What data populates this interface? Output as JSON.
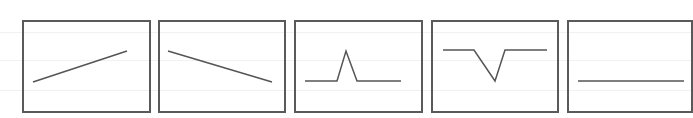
{
  "diagram": {
    "stroke_color": "#555555",
    "border_color": "#5a5a5a",
    "background_lines_y": [
      32,
      60,
      90
    ],
    "panels": [
      {
        "name": "rising-line",
        "frame": {
          "x": 22,
          "y": 20,
          "w": 125,
          "h": 89
        },
        "points": [
          [
            33,
            82
          ],
          [
            127,
            51
          ]
        ]
      },
      {
        "name": "falling-line",
        "frame": {
          "x": 158,
          "y": 20,
          "w": 125,
          "h": 89
        },
        "points": [
          [
            168,
            51
          ],
          [
            272,
            82
          ]
        ]
      },
      {
        "name": "peak-line",
        "frame": {
          "x": 294,
          "y": 20,
          "w": 126,
          "h": 89
        },
        "points": [
          [
            305,
            81
          ],
          [
            337,
            81
          ],
          [
            346,
            51
          ],
          [
            357,
            81
          ],
          [
            401,
            81
          ]
        ]
      },
      {
        "name": "valley-line",
        "frame": {
          "x": 431,
          "y": 20,
          "w": 125,
          "h": 89
        },
        "points": [
          [
            443,
            50
          ],
          [
            474,
            50
          ],
          [
            495,
            81
          ],
          [
            505,
            50
          ],
          [
            547,
            50
          ]
        ]
      },
      {
        "name": "flat-line",
        "frame": {
          "x": 567,
          "y": 20,
          "w": 122,
          "h": 89
        },
        "points": [
          [
            578,
            81
          ],
          [
            684,
            81
          ]
        ]
      }
    ]
  }
}
